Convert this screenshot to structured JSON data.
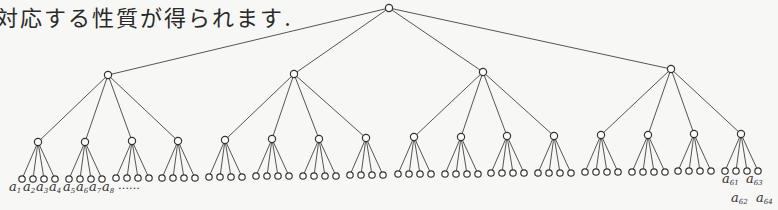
{
  "caption": "対応する性質が得られます.",
  "tree": {
    "root": {
      "x": 389,
      "y": 8
    },
    "level1": [
      {
        "x": 108,
        "y": 75
      },
      {
        "x": 294,
        "y": 74
      },
      {
        "x": 483,
        "y": 72
      },
      {
        "x": 671,
        "y": 69
      }
    ],
    "level2": [
      {
        "x": 38,
        "y": 142,
        "p": 0
      },
      {
        "x": 85,
        "y": 142,
        "p": 0
      },
      {
        "x": 132,
        "y": 141,
        "p": 0
      },
      {
        "x": 178,
        "y": 141,
        "p": 0
      },
      {
        "x": 225,
        "y": 140,
        "p": 1
      },
      {
        "x": 272,
        "y": 139,
        "p": 1
      },
      {
        "x": 319,
        "y": 139,
        "p": 1
      },
      {
        "x": 366,
        "y": 138,
        "p": 1
      },
      {
        "x": 414,
        "y": 137,
        "p": 2
      },
      {
        "x": 461,
        "y": 137,
        "p": 2
      },
      {
        "x": 507,
        "y": 136,
        "p": 2
      },
      {
        "x": 554,
        "y": 136,
        "p": 2
      },
      {
        "x": 601,
        "y": 135,
        "p": 3
      },
      {
        "x": 648,
        "y": 135,
        "p": 3
      },
      {
        "x": 694,
        "y": 134,
        "p": 3
      },
      {
        "x": 741,
        "y": 134,
        "p": 3
      }
    ],
    "leaf_offsets": [
      -16,
      -5,
      6,
      17
    ],
    "leaf_drop": 37
  },
  "labels": {
    "left": [
      {
        "text": "a",
        "sub": "1",
        "x": 9,
        "y": 191
      },
      {
        "text": "a",
        "sub": "2",
        "x": 23,
        "y": 191
      },
      {
        "text": "a",
        "sub": "3",
        "x": 36,
        "y": 191
      },
      {
        "text": "a",
        "sub": "4",
        "x": 49,
        "y": 191
      },
      {
        "text": "a",
        "sub": "5",
        "x": 63,
        "y": 191
      },
      {
        "text": "a",
        "sub": "6",
        "x": 76,
        "y": 191
      },
      {
        "text": "a",
        "sub": "7",
        "x": 89,
        "y": 191
      },
      {
        "text": "a",
        "sub": "8",
        "x": 102,
        "y": 191
      }
    ],
    "ellipsis": {
      "text": "……",
      "x": 118,
      "y": 189
    },
    "right": [
      {
        "text": "a",
        "sub": "61",
        "x": 722,
        "y": 183
      },
      {
        "text": "a",
        "sub": "62",
        "x": 731,
        "y": 202
      },
      {
        "text": "a",
        "sub": "63",
        "x": 746,
        "y": 183
      },
      {
        "text": "a",
        "sub": "64",
        "x": 756,
        "y": 202
      }
    ]
  }
}
